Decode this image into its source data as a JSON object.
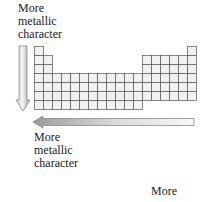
{
  "labels": {
    "vertical_arrow_label": "More\nmetallic\ncharacter",
    "horizontal_arrow_label": "More\nmetallic\ncharacter",
    "bottom_partial_label": "More"
  },
  "arrows": {
    "vertical": {
      "direction": "down"
    },
    "horizontal": {
      "direction": "left"
    }
  },
  "periodic_table": {
    "columns": 18,
    "rows": 7,
    "cell_size": 9,
    "origin": [
      34,
      46
    ],
    "colors": {
      "line": "#555555",
      "fill": "#f2f2f2"
    }
  },
  "colors": {
    "arrow_fill_light": "#f4f4f4",
    "arrow_fill_dark": "#9a9a9a",
    "arrow_stroke": "#8a8a8a"
  }
}
